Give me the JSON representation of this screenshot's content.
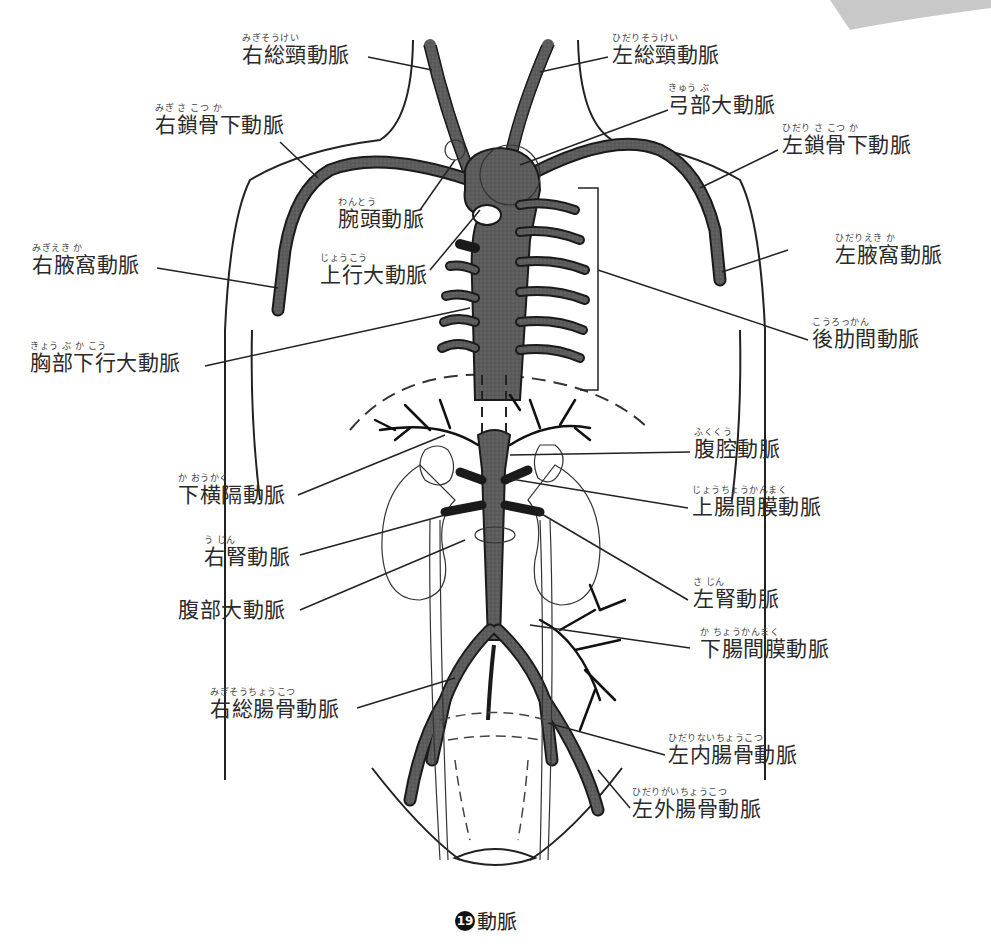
{
  "figure": {
    "caption_number": "19",
    "caption_text": "動脈"
  },
  "labels": [
    {
      "id": "right-common-carotid",
      "ruby": "みぎそうけい",
      "text": "右総頸動脈"
    },
    {
      "id": "left-common-carotid",
      "ruby": "ひだりそうけい",
      "text": "左総頸動脈"
    },
    {
      "id": "aortic-arch",
      "ruby": "きゅう ぶ",
      "text": "弓部大動脈"
    },
    {
      "id": "right-subclavian",
      "ruby": "みぎ さ こつ か",
      "text": "右鎖骨下動脈"
    },
    {
      "id": "left-subclavian",
      "ruby": "ひだり さ こつ か",
      "text": "左鎖骨下動脈"
    },
    {
      "id": "brachiocephalic",
      "ruby": "わんとう",
      "text": "腕頭動脈"
    },
    {
      "id": "ascending-aorta",
      "ruby": "じょうこう",
      "text": "上行大動脈"
    },
    {
      "id": "right-axillary",
      "ruby": "みぎえき か",
      "text": "右腋窩動脈"
    },
    {
      "id": "left-axillary",
      "ruby": "ひだりえき か",
      "text": "左腋窩動脈"
    },
    {
      "id": "posterior-intercostal",
      "ruby": "こうろっかん",
      "text": "後肋間動脈"
    },
    {
      "id": "descending-thoracic-aorta",
      "ruby": "きょう ぶ か こう",
      "text": "胸部下行大動脈"
    },
    {
      "id": "celiac",
      "ruby": "ふくくう",
      "text": "腹腔動脈"
    },
    {
      "id": "inferior-phrenic",
      "ruby": "か おうかく",
      "text": "下横隔動脈"
    },
    {
      "id": "superior-mesenteric",
      "ruby": "じょうちょうかんまく",
      "text": "上腸間膜動脈"
    },
    {
      "id": "right-renal",
      "ruby": "う じん",
      "text": "右腎動脈"
    },
    {
      "id": "abdominal-aorta",
      "ruby": "",
      "text": "腹部大動脈"
    },
    {
      "id": "left-renal",
      "ruby": "さ じん",
      "text": "左腎動脈"
    },
    {
      "id": "inferior-mesenteric",
      "ruby": "か ちょうかんまく",
      "text": "下腸間膜動脈"
    },
    {
      "id": "right-common-iliac",
      "ruby": "みぎそうちょうこつ",
      "text": "右総腸骨動脈"
    },
    {
      "id": "left-internal-iliac",
      "ruby": "ひだりないちょうこつ",
      "text": "左内腸骨動脈"
    },
    {
      "id": "left-external-iliac",
      "ruby": "ひだりがいちょうこつ",
      "text": "左外腸骨動脈"
    }
  ],
  "colors": {
    "artery_fill": "#5a5a5a",
    "outline": "#1a1a1a",
    "leader_line": "#222222",
    "background": "#ffffff"
  }
}
